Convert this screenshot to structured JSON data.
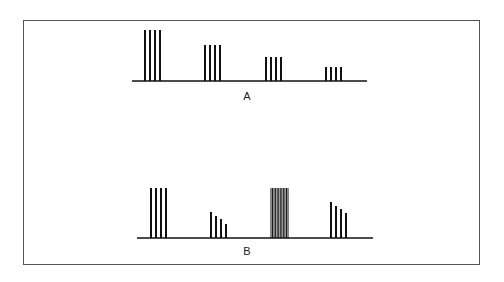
{
  "diagram": {
    "panels": [
      {
        "label": "A",
        "baseline": {
          "x1": 132,
          "x2": 367,
          "y": 81
        },
        "groups": [
          {
            "bars": [
              {
                "x": 145,
                "top": 30
              },
              {
                "x": 150,
                "top": 30
              },
              {
                "x": 155,
                "top": 30
              },
              {
                "x": 160,
                "top": 30
              }
            ]
          },
          {
            "bars": [
              {
                "x": 205,
                "top": 45
              },
              {
                "x": 210,
                "top": 45
              },
              {
                "x": 215,
                "top": 45
              },
              {
                "x": 220,
                "top": 45
              }
            ]
          },
          {
            "bars": [
              {
                "x": 266,
                "top": 57
              },
              {
                "x": 271,
                "top": 57
              },
              {
                "x": 276,
                "top": 57
              },
              {
                "x": 281,
                "top": 57
              }
            ]
          },
          {
            "bars": [
              {
                "x": 326,
                "top": 67
              },
              {
                "x": 331,
                "top": 67
              },
              {
                "x": 336,
                "top": 67
              },
              {
                "x": 341,
                "top": 67
              }
            ]
          }
        ]
      },
      {
        "label": "B",
        "baseline": {
          "x1": 137,
          "x2": 373,
          "y": 238
        },
        "groups": [
          {
            "bars": [
              {
                "x": 151,
                "top": 188
              },
              {
                "x": 156,
                "top": 188
              },
              {
                "x": 161,
                "top": 188
              },
              {
                "x": 166,
                "top": 188
              }
            ]
          },
          {
            "bars": [
              {
                "x": 211,
                "top": 212
              },
              {
                "x": 216,
                "top": 216
              },
              {
                "x": 221,
                "top": 219
              },
              {
                "x": 226,
                "top": 224
              }
            ]
          },
          {
            "dense": true,
            "x1": 271,
            "x2": 288,
            "top": 188,
            "count": 12
          },
          {
            "bars": [
              {
                "x": 331,
                "top": 202
              },
              {
                "x": 336,
                "top": 206
              },
              {
                "x": 341,
                "top": 209
              },
              {
                "x": 346,
                "top": 213
              }
            ]
          }
        ]
      }
    ],
    "colors": {
      "ink": "#111111",
      "border": "#555555"
    }
  },
  "labels": {
    "a": "A",
    "b": "B"
  }
}
